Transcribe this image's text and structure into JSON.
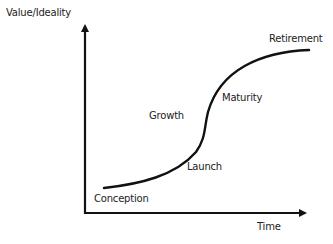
{
  "axes": {
    "y_label": "Value/Ideality",
    "x_label": "Time"
  },
  "stages": [
    {
      "label": "Conception"
    },
    {
      "label": "Launch"
    },
    {
      "label": "Growth"
    },
    {
      "label": "Maturity"
    },
    {
      "label": "Retirement"
    }
  ],
  "colors": {
    "line": "#111111",
    "text": "#222222",
    "background": "#ffffff"
  }
}
